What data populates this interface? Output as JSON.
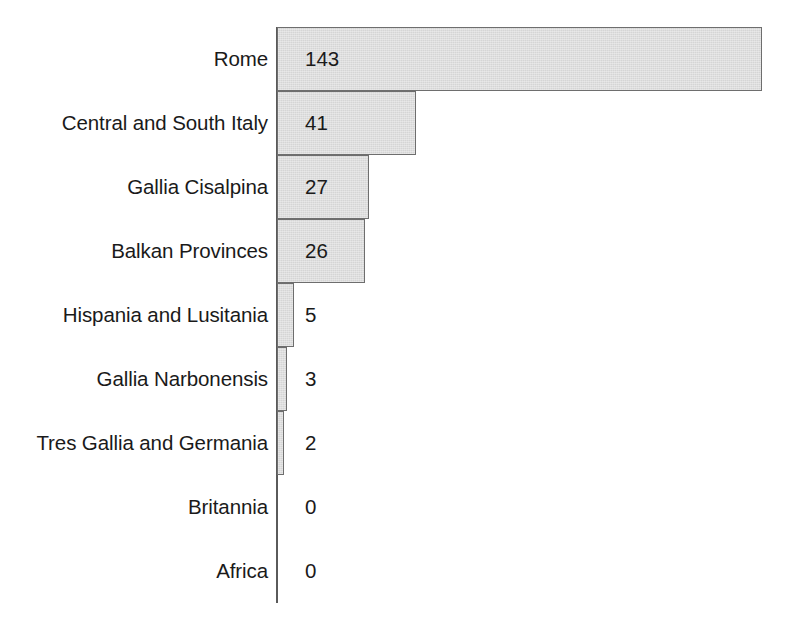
{
  "chart_data": {
    "type": "bar",
    "orientation": "horizontal",
    "title": "",
    "subtitle": "",
    "xlabel": "",
    "ylabel": "",
    "grid": false,
    "legend": null,
    "axis_ticks": [],
    "xlim": [
      0,
      143
    ],
    "categories": [
      "Rome",
      "Central and South Italy",
      "Gallia Cisalpina",
      "Balkan Provinces",
      "Hispania and Lusitania",
      "Gallia Narbonensis",
      "Tres Gallia and Germania",
      "Britannia",
      "Africa"
    ],
    "values": [
      143,
      41,
      27,
      26,
      5,
      3,
      2,
      0,
      0
    ],
    "data_labels": [
      "143",
      "41",
      "27",
      "26",
      "5",
      "3",
      "2",
      "0",
      "0"
    ],
    "colors": {
      "bar_fill": "#d5d5d5",
      "bar_border": "#6e6e6e",
      "axis_line": "#5a5a5a",
      "text": "#1a1a1a",
      "background": "#ffffff"
    }
  },
  "rows": [
    {
      "label": "Rome",
      "value": "143"
    },
    {
      "label": "Central and South Italy",
      "value": "41"
    },
    {
      "label": "Gallia Cisalpina",
      "value": "27"
    },
    {
      "label": "Balkan Provinces",
      "value": "26"
    },
    {
      "label": "Hispania and Lusitania",
      "value": "5"
    },
    {
      "label": "Gallia Narbonensis",
      "value": "3"
    },
    {
      "label": "Tres Gallia and Germania",
      "value": "2"
    },
    {
      "label": "Britannia",
      "value": "0"
    },
    {
      "label": "Africa",
      "value": "0"
    }
  ]
}
